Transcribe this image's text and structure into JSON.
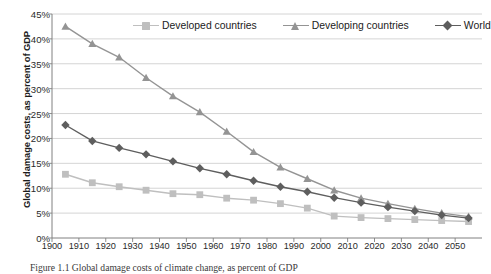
{
  "figure": {
    "caption": "Figure 1.1  Global damage costs of climate change, as percent of GDP"
  },
  "chart_data": {
    "type": "line",
    "title": "",
    "xlabel": "",
    "ylabel": "Global damage costs, as percent of GDP",
    "xlim": [
      1900,
      2060
    ],
    "ylim": [
      0,
      45
    ],
    "ytick_labels": [
      "0%",
      "5%",
      "10%",
      "15%",
      "20%",
      "25%",
      "30%",
      "35%",
      "40%",
      "45%"
    ],
    "ytick_values": [
      0,
      5,
      10,
      15,
      20,
      25,
      30,
      35,
      40,
      45
    ],
    "xtick_labels": [
      "1900",
      "1910",
      "1920",
      "1930",
      "1940",
      "1950",
      "1960",
      "1970",
      "1980",
      "1990",
      "2000",
      "2010",
      "2020",
      "2030",
      "2040",
      "2050"
    ],
    "xtick_values": [
      1900,
      1910,
      1920,
      1930,
      1940,
      1950,
      1960,
      1970,
      1980,
      1990,
      2000,
      2010,
      2020,
      2030,
      2040,
      2050
    ],
    "grid": "horizontal",
    "legend_position": "top",
    "x": [
      1905,
      1915,
      1925,
      1935,
      1945,
      1955,
      1965,
      1975,
      1985,
      1995,
      2005,
      2015,
      2025,
      2035,
      2045,
      2055
    ],
    "series": [
      {
        "name": "Developed countries",
        "marker": "square",
        "color": "#bfbfbf",
        "values": [
          12.8,
          11.1,
          10.3,
          9.6,
          8.9,
          8.7,
          8.0,
          7.6,
          6.9,
          6.0,
          4.4,
          4.1,
          3.9,
          3.7,
          3.5,
          3.3
        ]
      },
      {
        "name": "Developing countries",
        "marker": "triangle",
        "color": "#949494",
        "values": [
          42.5,
          39.0,
          36.3,
          32.2,
          28.5,
          25.3,
          21.4,
          17.3,
          14.2,
          11.9,
          9.6,
          8.0,
          6.9,
          5.9,
          5.0,
          4.3
        ]
      },
      {
        "name": "World",
        "marker": "diamond",
        "color": "#5e5e5e",
        "values": [
          22.7,
          19.5,
          18.1,
          16.8,
          15.4,
          14.0,
          12.8,
          11.5,
          10.3,
          9.3,
          8.1,
          7.1,
          6.2,
          5.4,
          4.6,
          4.0
        ]
      }
    ]
  },
  "legend": {
    "items": [
      {
        "label": "Developed countries"
      },
      {
        "label": "Developing countries"
      },
      {
        "label": "World"
      }
    ]
  }
}
